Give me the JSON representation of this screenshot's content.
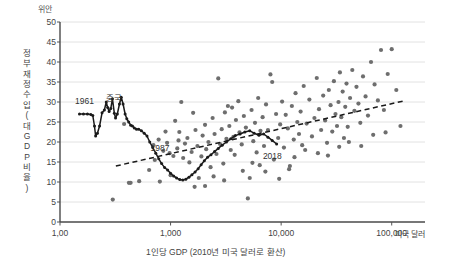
{
  "chart_data": {
    "type": "scatter",
    "title": "",
    "unit_top": "위안",
    "ylabel": "정부 재정수입 (대 GDP 비율)",
    "ylabel_chars": [
      "정",
      "부",
      "재",
      "정",
      "수",
      "입",
      "(",
      "대",
      "G",
      "D",
      "P",
      "비",
      "율",
      ")"
    ],
    "xlabel": "1인당 GDP (2010년 미국 달러로 환산)",
    "xunit": "미국 달러",
    "ylim": [
      0,
      50
    ],
    "yticks": [
      0,
      5,
      10,
      15,
      20,
      25,
      30,
      35,
      40,
      45,
      50
    ],
    "xlim": [
      100,
      200000
    ],
    "xticks": [
      100,
      1000,
      10000,
      100000
    ],
    "xticklabels": [
      "1,00",
      "1,000",
      "10,000",
      "100,000"
    ],
    "xscale": "log",
    "grid": "horizontal",
    "legend": "none",
    "annotations": [
      {
        "text": "중국",
        "x": 330,
        "y": 31.5
      },
      {
        "text": "1961",
        "x": 172,
        "y": 30.3
      },
      {
        "text": "1987",
        "x": 830,
        "y": 18.6
      },
      {
        "text": "2018",
        "x": 8600,
        "y": 16.4
      }
    ],
    "series": [
      {
        "name": "중국 (China time path 1961-2018)",
        "type": "line",
        "color": "#1a1a1a",
        "points": [
          [
            150,
            27.0
          ],
          [
            163,
            27.0
          ],
          [
            177,
            27.0
          ],
          [
            190,
            26.9
          ],
          [
            198,
            26.6
          ],
          [
            205,
            24.0
          ],
          [
            210,
            21.5
          ],
          [
            218,
            22.2
          ],
          [
            228,
            24.0
          ],
          [
            240,
            27.3
          ],
          [
            252,
            28.0
          ],
          [
            262,
            30.0
          ],
          [
            270,
            28.6
          ],
          [
            278,
            27.6
          ],
          [
            288,
            28.4
          ],
          [
            298,
            30.8
          ],
          [
            310,
            27.2
          ],
          [
            318,
            26.0
          ],
          [
            330,
            27.0
          ],
          [
            345,
            29.5
          ],
          [
            358,
            31.2
          ],
          [
            372,
            29.5
          ],
          [
            388,
            27.0
          ],
          [
            402,
            25.8
          ],
          [
            418,
            25.0
          ],
          [
            436,
            24.2
          ],
          [
            452,
            24.0
          ],
          [
            470,
            23.5
          ],
          [
            492,
            23.2
          ],
          [
            515,
            23.2
          ],
          [
            545,
            22.8
          ],
          [
            578,
            22.2
          ],
          [
            612,
            21.5
          ],
          [
            648,
            20.0
          ],
          [
            690,
            18.6
          ],
          [
            735,
            17.2
          ],
          [
            782,
            15.8
          ],
          [
            830,
            14.6
          ],
          [
            884,
            13.6
          ],
          [
            940,
            13.0
          ],
          [
            1000,
            12.2
          ],
          [
            1065,
            11.5
          ],
          [
            1135,
            11.0
          ],
          [
            1210,
            10.6
          ],
          [
            1290,
            10.5
          ],
          [
            1375,
            10.7
          ],
          [
            1465,
            11.2
          ],
          [
            1560,
            11.8
          ],
          [
            1665,
            12.5
          ],
          [
            1775,
            13.3
          ],
          [
            1890,
            14.3
          ],
          [
            2020,
            15.3
          ],
          [
            2160,
            16.2
          ],
          [
            2320,
            16.8
          ],
          [
            2500,
            17.6
          ],
          [
            2700,
            18.4
          ],
          [
            2930,
            19.2
          ],
          [
            3200,
            20.0
          ],
          [
            3500,
            20.8
          ],
          [
            3850,
            21.6
          ],
          [
            4250,
            22.0
          ],
          [
            4700,
            22.5
          ],
          [
            5200,
            22.8
          ],
          [
            5700,
            22.2
          ],
          [
            6300,
            21.7
          ],
          [
            6950,
            22.0
          ],
          [
            7600,
            21.2
          ],
          [
            8300,
            20.4
          ],
          [
            9100,
            19.5
          ]
        ]
      },
      {
        "name": "국가별 관측치 (cross-country scatter)",
        "type": "scatter",
        "color": "#6e6e6e",
        "points": [
          [
            300,
            5.6
          ],
          [
            420,
            9.8
          ],
          [
            435,
            9.8
          ],
          [
            520,
            10.2
          ],
          [
            380,
            24.5
          ],
          [
            640,
            13.0
          ],
          [
            700,
            19.2
          ],
          [
            720,
            15.5
          ],
          [
            780,
            20.6
          ],
          [
            800,
            10.1
          ],
          [
            860,
            17.8
          ],
          [
            900,
            22.6
          ],
          [
            930,
            19.8
          ],
          [
            980,
            17.2
          ],
          [
            1000,
            11.7
          ],
          [
            1060,
            16.5
          ],
          [
            1100,
            25.3
          ],
          [
            1150,
            18.4
          ],
          [
            1180,
            20.4
          ],
          [
            1200,
            22.5
          ],
          [
            1250,
            30.0
          ],
          [
            1300,
            16.0
          ],
          [
            1350,
            19.6
          ],
          [
            1420,
            21.0
          ],
          [
            1480,
            14.9
          ],
          [
            1550,
            17.5
          ],
          [
            1600,
            27.3
          ],
          [
            1680,
            23.0
          ],
          [
            1750,
            19.0
          ],
          [
            1800,
            11.0
          ],
          [
            1900,
            16.4
          ],
          [
            1950,
            21.6
          ],
          [
            2050,
            24.3
          ],
          [
            2100,
            18.2
          ],
          [
            2200,
            20.0
          ],
          [
            2300,
            13.7
          ],
          [
            2400,
            26.0
          ],
          [
            2500,
            22.0
          ],
          [
            2600,
            17.0
          ],
          [
            2700,
            35.9
          ],
          [
            2800,
            19.5
          ],
          [
            2900,
            23.2
          ],
          [
            3000,
            14.6
          ],
          [
            3100,
            27.4
          ],
          [
            3200,
            20.8
          ],
          [
            3300,
            29.0
          ],
          [
            3400,
            24.0
          ],
          [
            3500,
            18.0
          ],
          [
            3600,
            28.6
          ],
          [
            3700,
            21.3
          ],
          [
            3800,
            16.8
          ],
          [
            3900,
            25.5
          ],
          [
            4100,
            30.2
          ],
          [
            4200,
            22.4
          ],
          [
            4400,
            19.4
          ],
          [
            4600,
            26.5
          ],
          [
            4800,
            23.6
          ],
          [
            5000,
            5.9
          ],
          [
            5200,
            11.0
          ],
          [
            5400,
            28.0
          ],
          [
            5600,
            20.2
          ],
          [
            5800,
            24.8
          ],
          [
            6000,
            17.4
          ],
          [
            6200,
            31.0
          ],
          [
            6500,
            22.8
          ],
          [
            6800,
            26.2
          ],
          [
            7000,
            19.0
          ],
          [
            7300,
            29.4
          ],
          [
            7600,
            23.0
          ],
          [
            8000,
            36.9
          ],
          [
            8300,
            35.0
          ],
          [
            8600,
            15.6
          ],
          [
            9000,
            27.0
          ],
          [
            9400,
            21.0
          ],
          [
            9800,
            24.4
          ],
          [
            10200,
            30.1
          ],
          [
            10600,
            18.6
          ],
          [
            11000,
            26.8
          ],
          [
            11500,
            23.4
          ],
          [
            12000,
            14.0
          ],
          [
            12500,
            29.0
          ],
          [
            13000,
            20.6
          ],
          [
            13500,
            32.2
          ],
          [
            14000,
            25.0
          ],
          [
            14500,
            22.0
          ],
          [
            15000,
            27.6
          ],
          [
            15500,
            19.2
          ],
          [
            16000,
            34.0
          ],
          [
            17000,
            24.6
          ],
          [
            18000,
            30.6
          ],
          [
            19000,
            21.4
          ],
          [
            20000,
            26.0
          ],
          [
            21000,
            36.0
          ],
          [
            22000,
            28.2
          ],
          [
            23000,
            23.0
          ],
          [
            24000,
            31.6
          ],
          [
            25000,
            25.4
          ],
          [
            26000,
            19.8
          ],
          [
            27000,
            33.0
          ],
          [
            28000,
            29.2
          ],
          [
            29000,
            22.6
          ],
          [
            30000,
            35.2
          ],
          [
            31000,
            27.0
          ],
          [
            32000,
            24.0
          ],
          [
            33000,
            30.0
          ],
          [
            34000,
            37.4
          ],
          [
            35000,
            26.2
          ],
          [
            36000,
            32.6
          ],
          [
            37000,
            21.0
          ],
          [
            38000,
            28.8
          ],
          [
            39000,
            34.6
          ],
          [
            40000,
            23.8
          ],
          [
            42000,
            31.0
          ],
          [
            44000,
            38.0
          ],
          [
            46000,
            27.8
          ],
          [
            48000,
            33.8
          ],
          [
            50000,
            29.6
          ],
          [
            52000,
            24.8
          ],
          [
            55000,
            36.4
          ],
          [
            58000,
            31.4
          ],
          [
            61000,
            26.6
          ],
          [
            65000,
            40.0
          ],
          [
            70000,
            34.4
          ],
          [
            75000,
            30.4
          ],
          [
            80000,
            43.0
          ],
          [
            85000,
            28.0
          ],
          [
            92000,
            37.0
          ],
          [
            100000,
            43.2
          ],
          [
            110000,
            33.0
          ],
          [
            7200,
            12.6
          ],
          [
            9600,
            10.8
          ],
          [
            11800,
            13.2
          ],
          [
            6400,
            14.2
          ],
          [
            4500,
            12.8
          ],
          [
            2050,
            9.0
          ],
          [
            3050,
            10.4
          ],
          [
            1650,
            8.8
          ],
          [
            2450,
            11.4
          ],
          [
            5500,
            14.8
          ],
          [
            13200,
            16.2
          ],
          [
            16500,
            18.0
          ],
          [
            21500,
            17.2
          ],
          [
            26500,
            16.6
          ],
          [
            33500,
            18.8
          ],
          [
            41000,
            20.0
          ],
          [
            53000,
            19.0
          ],
          [
            68000,
            21.8
          ],
          [
            88000,
            22.4
          ],
          [
            120000,
            24.0
          ]
        ]
      },
      {
        "name": "추세선 (trend line)",
        "type": "dashed-line",
        "color": "#1a1a1a",
        "points": [
          [
            320,
            14.0
          ],
          [
            130000,
            30.3
          ]
        ]
      }
    ]
  }
}
